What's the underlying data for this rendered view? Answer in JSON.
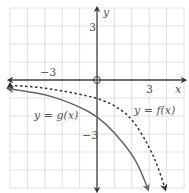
{
  "chart_data": {
    "type": "line",
    "title": "",
    "xlabel": "x",
    "ylabel": "y",
    "xlim": [
      -5,
      5
    ],
    "ylim": [
      -6,
      4
    ],
    "grid": true,
    "grid_step": 1,
    "x_tick_labels": [
      {
        "value": -3,
        "label": "−3"
      },
      {
        "value": 3,
        "label": "3"
      }
    ],
    "y_tick_labels": [
      {
        "value": 3,
        "label": "3"
      },
      {
        "value": -3,
        "label": "−3"
      }
    ],
    "origin_marker": "open-circle",
    "series": [
      {
        "name": "y = f(x)",
        "style": "dashed",
        "color": "#333333",
        "arrow_left": true,
        "arrow_bottom": true,
        "x": [
          -5,
          -4,
          -3,
          -2,
          -1,
          0,
          1,
          2,
          3,
          3.5,
          3.9
        ],
        "y": [
          -0.3,
          -0.35,
          -0.45,
          -0.6,
          -0.8,
          -1.0,
          -1.4,
          -2.1,
          -3.7,
          -4.8,
          -6.0
        ]
      },
      {
        "name": "y = g(x)",
        "style": "solid",
        "color": "#777777",
        "arrow_left": true,
        "arrow_bottom": true,
        "x": [
          -5,
          -4,
          -3,
          -2,
          -1,
          0,
          1,
          2,
          2.5,
          2.9
        ],
        "y": [
          -0.5,
          -0.65,
          -0.8,
          -1.1,
          -1.5,
          -2.0,
          -2.9,
          -4.1,
          -5.0,
          -6.0
        ]
      }
    ],
    "annotations": [
      {
        "text": "y = g(x)",
        "x": -2.6,
        "y": -2.0
      },
      {
        "text": "y = f(x)",
        "x": 3.0,
        "y": -1.6
      }
    ]
  },
  "labels": {
    "x_axis": "x",
    "y_axis": "y",
    "x_neg3": "−3",
    "x_pos3": "3",
    "y_pos3": "3",
    "y_neg3": "−3",
    "g_label_y": "y",
    "g_label_eq": " = ",
    "g_label_fn": "g(x)",
    "f_label_y": "y",
    "f_label_eq": " = ",
    "f_label_fn": "f(x)"
  }
}
